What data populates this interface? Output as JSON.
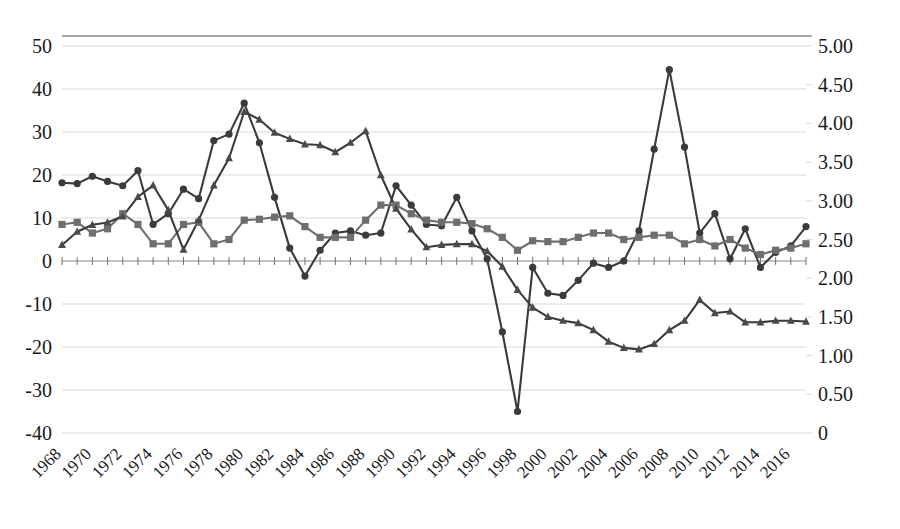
{
  "chart_data": {
    "type": "line",
    "title": "",
    "subtitle": "",
    "xlabel": "",
    "ylabel": "",
    "grid": true,
    "legend": "none",
    "x": [
      1968,
      1969,
      1970,
      1971,
      1972,
      1973,
      1974,
      1975,
      1976,
      1977,
      1978,
      1979,
      1980,
      1981,
      1982,
      1983,
      1984,
      1985,
      1986,
      1987,
      1988,
      1989,
      1990,
      1991,
      1992,
      1993,
      1994,
      1995,
      1996,
      1997,
      1998,
      1999,
      2000,
      2001,
      2002,
      2003,
      2004,
      2005,
      2006,
      2007,
      2008,
      2009,
      2010,
      2011,
      2012,
      2013,
      2014,
      2015,
      2016,
      2017
    ],
    "xtick_labels": [
      "1968",
      "1970",
      "1972",
      "1974",
      "1976",
      "1978",
      "1980",
      "1982",
      "1984",
      "1986",
      "1988",
      "1990",
      "1992",
      "1994",
      "1996",
      "1998",
      "2000",
      "2002",
      "2004",
      "2006",
      "2008",
      "2010",
      "2012",
      "2014",
      "2016"
    ],
    "left_axis": {
      "ticks": [
        50,
        40,
        30,
        20,
        10,
        0,
        -10,
        -20,
        -30,
        -40
      ],
      "tick_labels": [
        "50",
        "40",
        "30",
        "20",
        "10",
        "0",
        "-10",
        "-20",
        "-30",
        "-40"
      ],
      "ylim": [
        -40,
        50
      ]
    },
    "right_axis": {
      "ticks": [
        5.0,
        4.5,
        4.0,
        3.5,
        3.0,
        2.5,
        2.0,
        1.5,
        1.0,
        0.5,
        0
      ],
      "tick_labels": [
        "5.00",
        "4.50",
        "4.00",
        "3.50",
        "3.00",
        "2.50",
        "2.00",
        "1.50",
        "1.00",
        "0.50",
        "0"
      ],
      "ylim": [
        0,
        5.0
      ]
    },
    "series": [
      {
        "name": "series-circle",
        "marker": "circle",
        "axis": "left",
        "color": "#3b3b3b",
        "values": [
          18.2,
          18.0,
          19.7,
          18.5,
          17.5,
          21.0,
          8.5,
          11.0,
          16.7,
          14.5,
          28.0,
          29.5,
          36.7,
          27.5,
          14.8,
          3.0,
          -3.5,
          2.5,
          6.5,
          7.0,
          6.0,
          6.5,
          17.5,
          13.0,
          8.5,
          8.2,
          14.8,
          7.0,
          0.5,
          -16.5,
          -35.0,
          -1.5,
          -7.5,
          -8.0,
          -4.5,
          -0.5,
          -1.5,
          0.0,
          7.0,
          26.0,
          44.5,
          26.5,
          6.5,
          11.0,
          0.5,
          7.5,
          -1.5,
          2.0,
          3.5,
          8.0
        ]
      },
      {
        "name": "series-square",
        "marker": "square",
        "axis": "left",
        "color": "#6e6e6e",
        "values": [
          8.5,
          9.0,
          6.5,
          7.5,
          11.0,
          8.5,
          4.0,
          4.0,
          8.5,
          9.0,
          4.0,
          5.0,
          9.5,
          9.7,
          10.2,
          10.5,
          8.0,
          5.5,
          5.5,
          5.5,
          9.5,
          13.0,
          13.0,
          11.0,
          9.5,
          9.0,
          9.0,
          8.7,
          7.5,
          5.5,
          2.5,
          4.7,
          4.5,
          4.5,
          5.5,
          6.5,
          6.5,
          5.0,
          5.5,
          6.0,
          6.0,
          4.0,
          5.0,
          3.5,
          5.0,
          3.0,
          1.5,
          2.5,
          3.0,
          4.0
        ]
      },
      {
        "name": "series-triangle",
        "marker": "triangle",
        "axis": "right",
        "color": "#4a4a4a",
        "values": [
          2.43,
          2.6,
          2.69,
          2.72,
          2.8,
          3.05,
          3.2,
          2.88,
          2.37,
          2.75,
          3.2,
          3.55,
          4.15,
          4.05,
          3.88,
          3.8,
          3.73,
          3.72,
          3.63,
          3.75,
          3.9,
          3.33,
          2.9,
          2.63,
          2.4,
          2.43,
          2.44,
          2.44,
          2.35,
          2.15,
          1.85,
          1.62,
          1.5,
          1.45,
          1.42,
          1.33,
          1.18,
          1.1,
          1.08,
          1.15,
          1.33,
          1.45,
          1.72,
          1.55,
          1.57,
          1.43,
          1.43,
          1.45,
          1.45,
          1.44
        ]
      }
    ]
  }
}
